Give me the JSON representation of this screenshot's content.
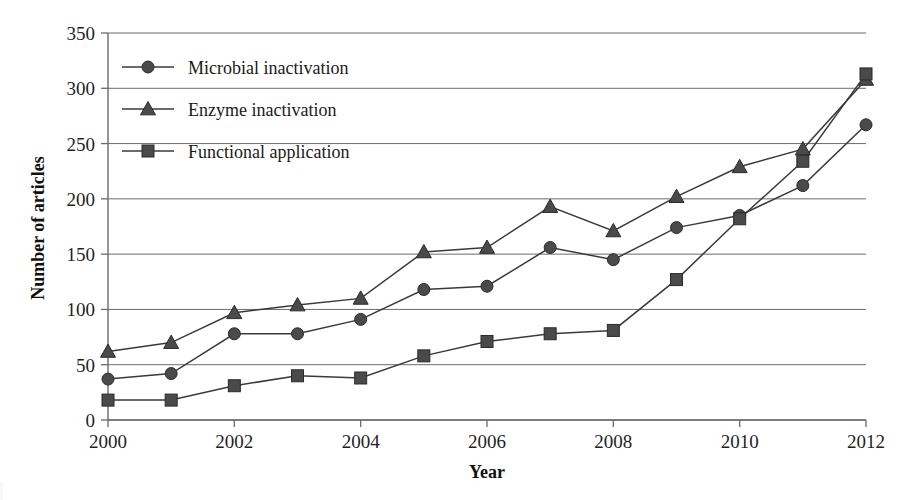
{
  "chart_data": {
    "type": "line",
    "title": "",
    "xlabel": "Year",
    "ylabel": "Number of articles",
    "x": [
      2000,
      2001,
      2002,
      2003,
      2004,
      2005,
      2006,
      2007,
      2008,
      2009,
      2010,
      2011,
      2012
    ],
    "xlim": [
      2000,
      2012
    ],
    "ylim": [
      0,
      350
    ],
    "xticks": [
      "2000",
      "2002",
      "2004",
      "2006",
      "2008",
      "2010",
      "2012"
    ],
    "xtick_values": [
      2000,
      2002,
      2004,
      2006,
      2008,
      2010,
      2012
    ],
    "yticks": [
      "0",
      "50",
      "100",
      "150",
      "200",
      "250",
      "300",
      "350"
    ],
    "ytick_values": [
      0,
      50,
      100,
      150,
      200,
      250,
      300,
      350
    ],
    "grid": true,
    "legend_position": "top-left-inside",
    "series": [
      {
        "name": "Microbial inactivation",
        "marker": "circle",
        "color": "#4a4a4a",
        "values": [
          37,
          42,
          78,
          78,
          91,
          118,
          121,
          156,
          145,
          174,
          185,
          212,
          267
        ]
      },
      {
        "name": "Enzyme inactivation",
        "marker": "triangle",
        "color": "#4a4a4a",
        "values": [
          62,
          70,
          97,
          104,
          110,
          152,
          156,
          193,
          171,
          202,
          229,
          245,
          308
        ]
      },
      {
        "name": "Functional application",
        "marker": "square",
        "color": "#4a4a4a",
        "values": [
          18,
          18,
          31,
          40,
          38,
          58,
          71,
          78,
          81,
          127,
          182,
          234,
          313
        ]
      }
    ]
  },
  "figure": {
    "axis_color": "#6b6b6b",
    "line_color": "#3a3a3a",
    "marker_color": "#4a4a4a",
    "background": "#ffffff"
  },
  "legend": {
    "entries": [
      {
        "label": "Microbial inactivation",
        "marker": "circle-marker-icon"
      },
      {
        "label": "Enzyme inactivation",
        "marker": "triangle-marker-icon"
      },
      {
        "label": "Functional application",
        "marker": "square-marker-icon"
      }
    ]
  }
}
